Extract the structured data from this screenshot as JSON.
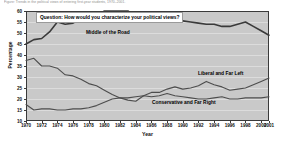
{
  "figure": {
    "cut_caption": "Figure: Trends in the political views of entering first-year students, 1970–2001."
  },
  "chart_data": {
    "type": "line",
    "title": "",
    "question_box": "Question: How would you characterize your political views?",
    "xlabel": "Year",
    "ylabel": "Percentage",
    "ylim": [
      10,
      60
    ],
    "xlim": [
      1970,
      2001
    ],
    "grid": true,
    "legend_position": "inline-annotations",
    "yticks": [
      60,
      55,
      50,
      45,
      40,
      35,
      30,
      25,
      20,
      15,
      10
    ],
    "xticks": [
      1970,
      1972,
      1974,
      1976,
      1978,
      1980,
      1982,
      1984,
      1986,
      1988,
      1990,
      1992,
      1994,
      1996,
      1998,
      2000,
      2001
    ],
    "x": [
      1970,
      1971,
      1972,
      1973,
      1974,
      1975,
      1976,
      1977,
      1978,
      1979,
      1980,
      1981,
      1982,
      1983,
      1984,
      1985,
      1986,
      1987,
      1988,
      1989,
      1990,
      1991,
      1992,
      1993,
      1994,
      1995,
      1996,
      1997,
      1998,
      1999,
      2000,
      2001
    ],
    "series": [
      {
        "name": "Middle of the Road",
        "color": "#3a3a3a",
        "values": [
          45.0,
          47.0,
          47.5,
          50.5,
          55.0,
          54.0,
          54.5,
          56.5,
          57.0,
          57.5,
          60.0,
          60.0,
          60.0,
          60.0,
          57.5,
          57.0,
          56.5,
          56.0,
          56.0,
          55.5,
          55.5,
          55.0,
          54.5,
          54.0,
          54.0,
          53.0,
          53.0,
          54.0,
          55.0,
          53.0,
          51.0,
          49.0
        ]
      },
      {
        "name": "Liberal and Far Left",
        "color": "#4d4d4d",
        "values": [
          37.5,
          38.5,
          35.0,
          35.0,
          34.0,
          31.0,
          30.5,
          29.0,
          27.0,
          26.0,
          24.0,
          22.0,
          20.5,
          19.5,
          19.0,
          21.5,
          23.0,
          23.0,
          24.5,
          25.5,
          24.5,
          25.0,
          26.0,
          28.0,
          26.5,
          25.5,
          24.0,
          24.5,
          25.0,
          26.5,
          28.0,
          29.5
        ]
      },
      {
        "name": "Conservative and Far Right",
        "color": "#4d4d4d",
        "values": [
          17.5,
          15.0,
          15.5,
          15.5,
          15.0,
          15.0,
          15.5,
          15.5,
          16.0,
          17.0,
          18.5,
          20.0,
          20.5,
          20.5,
          21.0,
          21.5,
          21.0,
          21.5,
          22.5,
          21.5,
          21.0,
          20.5,
          20.0,
          20.0,
          20.5,
          21.0,
          20.0,
          20.0,
          20.5,
          20.5,
          20.5,
          21.0
        ]
      }
    ],
    "annotations": [
      {
        "text": "Middle of the Road"
      },
      {
        "text": "Liberal and Far Left"
      },
      {
        "text": "Conservative and Far Right"
      }
    ]
  }
}
